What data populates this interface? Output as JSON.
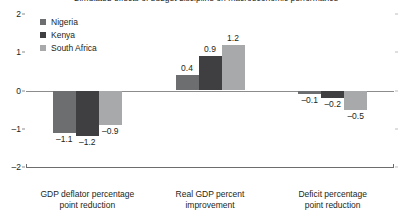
{
  "chart_data": {
    "type": "bar",
    "title": "Simulated effects of budget discipline on macroeconomic performance",
    "title_truncated": true,
    "xlabel": "",
    "ylabel": "",
    "ylim": [
      -2,
      2
    ],
    "yticks": [
      2,
      1,
      0,
      -1,
      -2
    ],
    "ytick_labels": [
      "2",
      "1",
      "0",
      "–1",
      "–2"
    ],
    "grid": false,
    "legend_position": "top-left",
    "categories": [
      "GDP deflator percentage point reduction",
      "Real GDP percent improvement",
      "Deficit percentage point reduction"
    ],
    "category_lines": [
      [
        "GDP deflator percentage",
        "point reduction"
      ],
      [
        "Real GDP percent",
        "improvement"
      ],
      [
        "Deficit percentage",
        "point reduction"
      ]
    ],
    "series": [
      {
        "name": "Nigeria",
        "color": "#6d6e70",
        "values": [
          -1.1,
          0.4,
          -0.1
        ],
        "labels": [
          "–1.1",
          "0.4",
          "–0.1"
        ]
      },
      {
        "name": "Kenya",
        "color": "#3f3f41",
        "values": [
          -1.2,
          0.9,
          -0.2
        ],
        "labels": [
          "–1.2",
          "0.9",
          "–0.2"
        ]
      },
      {
        "name": "South Africa",
        "color": "#a7a9ab",
        "values": [
          -0.9,
          1.2,
          -0.5
        ],
        "labels": [
          "–0.9",
          "1.2",
          "–0.5"
        ]
      }
    ]
  }
}
